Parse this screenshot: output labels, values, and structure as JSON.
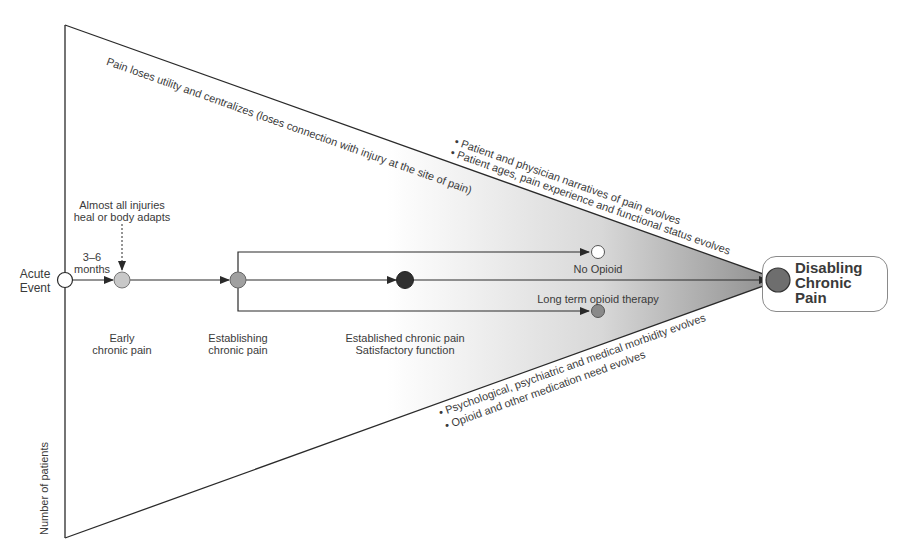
{
  "diagram": {
    "type": "flow-funnel",
    "y_axis_label": "Number of patients",
    "top_edge_label": "Pain loses utility and centralizes (loses connection with injury at the site of pain)",
    "upper_bullets": [
      "• Patient and physician narratives of pain evolves",
      "• Patient ages, pain experience and functional status evolves"
    ],
    "lower_bullets": [
      "• Psychological, psychiatric and medical morbidity evolves",
      "• Opioid and other medication need evolves"
    ],
    "nodes": {
      "acute_event": {
        "label": "Acute\nEvent",
        "fill": "#ffffff"
      },
      "early": {
        "label_line1": "Early",
        "label_line2": "chronic pain",
        "fill": "#c8c8c8"
      },
      "establishing": {
        "label_line1": "Establishing",
        "label_line2": "chronic pain",
        "fill": "#a0a0a0"
      },
      "established": {
        "label_line1": "Established chronic pain",
        "label_line2": "Satisfactory function",
        "fill": "#303030"
      },
      "no_opioid": {
        "label": "No Opioid",
        "fill": "#ffffff"
      },
      "long_term": {
        "label": "Long term opioid therapy",
        "fill": "#8a8a8a"
      },
      "disabling": {
        "label": "Disabling\nChronic\nPain",
        "fill": "#6e6e6e"
      }
    },
    "annotations": {
      "time_interval_line1": "3–6",
      "time_interval_line2": "months",
      "heal_note_line1": "Almost all injuries",
      "heal_note_line2": "heal or body adapts"
    },
    "colors": {
      "line": "#2a2a2a",
      "gradient_start": "#ffffff",
      "gradient_end": "#8c8c8c"
    }
  }
}
